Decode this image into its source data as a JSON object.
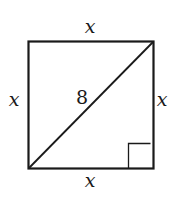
{
  "figure": {
    "shape": "square",
    "side_labels": {
      "top": "x",
      "bottom": "x",
      "left": "x",
      "right": "x"
    },
    "diagonal_label": "8",
    "right_angle_marker": "bottom-right",
    "colors": {
      "stroke": "#1a1a1a",
      "background": "#ffffff"
    }
  }
}
